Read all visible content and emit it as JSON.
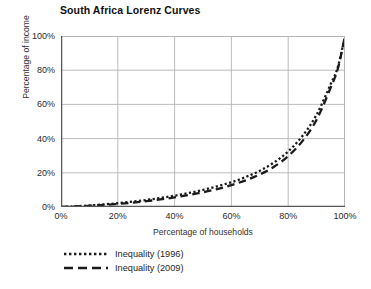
{
  "chart_data": {
    "type": "line",
    "title": "South Africa Lorenz Curves",
    "xlabel": "Percentage of households",
    "ylabel": "Percentage of income",
    "xlim": [
      0,
      100
    ],
    "ylim": [
      0,
      100
    ],
    "grid": true,
    "legend_position": "below-left",
    "x_ticks": [
      "0%",
      "20%",
      "40%",
      "60%",
      "80%",
      "100%"
    ],
    "y_ticks": [
      "0%",
      "20%",
      "40%",
      "60%",
      "80%",
      "100%"
    ],
    "x_tick_values": [
      0,
      20,
      40,
      60,
      80,
      100
    ],
    "y_tick_values": [
      0,
      20,
      40,
      60,
      80,
      100
    ],
    "x": [
      0,
      5,
      10,
      15,
      20,
      25,
      30,
      35,
      40,
      45,
      50,
      55,
      60,
      65,
      70,
      75,
      80,
      85,
      90,
      95,
      97.5,
      100
    ],
    "series": [
      {
        "name": "Inequality (1996)",
        "style": "dotted",
        "color": "#1a1a1a",
        "values": [
          0,
          0.4,
          0.9,
          1.5,
          2.2,
          3.1,
          4.1,
          5.3,
          6.6,
          8.2,
          10.0,
          12.1,
          14.5,
          17.5,
          21.2,
          26.0,
          32.5,
          41.5,
          54.0,
          72.0,
          82.0,
          100
        ]
      },
      {
        "name": "Inequality (2009)",
        "style": "dashed",
        "color": "#1a1a1a",
        "values": [
          0,
          0.3,
          0.7,
          1.2,
          1.8,
          2.5,
          3.4,
          4.4,
          5.6,
          7.0,
          8.6,
          10.5,
          12.8,
          15.6,
          19.0,
          23.5,
          29.8,
          38.5,
          51.0,
          70.0,
          81.0,
          100
        ]
      }
    ]
  },
  "legend": {
    "items": [
      {
        "label": "Inequality (1996)",
        "style": "dotted"
      },
      {
        "label": "Inequality (2009)",
        "style": "dashed"
      }
    ]
  },
  "colors": {
    "axis": "#555555",
    "grid": "#b5b5b5",
    "line": "#1a1a1a",
    "background": "#ffffff"
  }
}
